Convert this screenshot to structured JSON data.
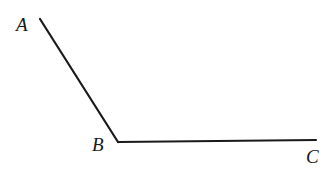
{
  "diagram": {
    "type": "angle",
    "points": {
      "A": {
        "label": "A",
        "x": 40,
        "y": 19
      },
      "B": {
        "label": "B",
        "x": 118,
        "y": 142
      },
      "C": {
        "label": "C",
        "x": 316,
        "y": 140
      }
    },
    "segments": [
      {
        "from": "A",
        "to": "B"
      },
      {
        "from": "B",
        "to": "C"
      }
    ],
    "stroke_color": "#1a1a1a"
  }
}
